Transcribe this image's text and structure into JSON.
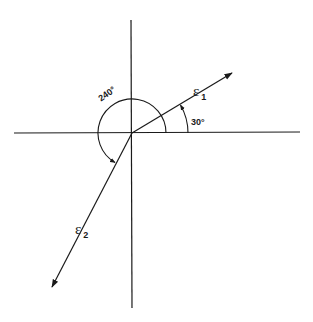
{
  "diagram": {
    "title": "",
    "axes": {
      "origin": [
        132,
        133
      ],
      "horizontal": {
        "x1": 14,
        "x2": 300
      },
      "vertical": {
        "y1": 20,
        "y2": 308
      }
    },
    "vectors": [
      {
        "name": "ε",
        "subscript": "1",
        "angle_deg": 30,
        "tip": [
          232,
          73
        ]
      },
      {
        "name": "ε",
        "subscript": "2",
        "angle_deg": 240,
        "tip": [
          52,
          287
        ]
      }
    ],
    "angle_labels": [
      {
        "text": "30°",
        "value": 30
      },
      {
        "text": "240°",
        "value": 240
      }
    ],
    "colors": {
      "line": "#1a1a1a",
      "background": "#ffffff"
    }
  },
  "labels": {
    "eps1_symbol": "ε",
    "eps1_sub": "1",
    "eps2_symbol": "ε",
    "eps2_sub": "2",
    "angle30": "30°",
    "angle240": "240°"
  }
}
